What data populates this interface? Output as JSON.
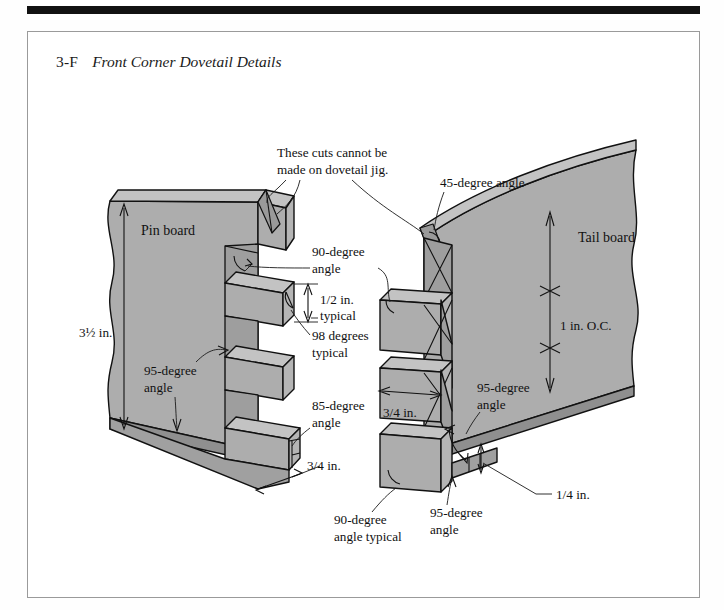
{
  "page": {
    "figure_number": "3-F",
    "figure_title": "Front Corner Dovetail Details",
    "background": "#ffffff",
    "frame_color": "#9a9a9a",
    "rule_color": "#111111"
  },
  "drawing": {
    "type": "isometric-technical-illustration",
    "subject": "hand-cut through dovetail joint, front corner",
    "fill_face": "#adadad",
    "fill_top": "#c3c3c3",
    "fill_end": "#8f8f8f",
    "fill_shadow": "#9a9a9a",
    "line_color": "#111111",
    "parts": [
      {
        "name": "pin-board",
        "label": "Pin board",
        "side": "left"
      },
      {
        "name": "tail-board",
        "label": "Tail board",
        "side": "right"
      }
    ]
  },
  "labels": {
    "pin_board": "Pin board",
    "tail_board": "Tail board",
    "note_jig_line1": "These cuts cannot be",
    "note_jig_line2": "made on dovetail jig.",
    "angle_45": "45-degree angle",
    "angle_90_line1": "90-degree",
    "angle_90_line2": "angle",
    "dim_half_line1": "1/2 in.",
    "dim_half_line2": "typical",
    "angle_98_line1": "98 degrees",
    "angle_98_line2": "typical",
    "angle_95_left_line1": "95-degree",
    "angle_95_left_line2": "angle",
    "angle_85_line1": "85-degree",
    "angle_85_line2": "angle",
    "dim_three_quarter_left": "3/4 in.",
    "dim_three_quarter_right": "3/4 in.",
    "dim_three_half": "3½ in.",
    "dim_one_inch_oc": "1 in. O.C.",
    "angle_95_right_line1": "95-degree",
    "angle_95_right_line2": "angle",
    "angle_95_bottom_line1": "95-degree",
    "angle_95_bottom_line2": "angle",
    "angle_90_typ_line1": "90-degree",
    "angle_90_typ_line2": "angle typical",
    "dim_quarter": "1/4 in."
  },
  "callouts": [
    {
      "id": "note-jig",
      "text": "These cuts cannot be made on dovetail jig.",
      "points_to": [
        "pin-board-top-cut",
        "tail-board-top-cut"
      ]
    },
    {
      "id": "angle-45",
      "text": "45-degree angle",
      "points_to": "tail-board-top-corner"
    },
    {
      "id": "angle-90",
      "text": "90-degree angle",
      "points_to": [
        "pin-socket-shoulder",
        "tail-socket-shoulder"
      ]
    },
    {
      "id": "dim-half",
      "text": "1/2 in. typical",
      "points_to": "pin-thickness"
    },
    {
      "id": "angle-98",
      "text": "98 degrees typical",
      "points_to": "pin-end-grain"
    },
    {
      "id": "angle-95-left",
      "text": "95-degree angle",
      "points_to": "pin-board-shoulder"
    },
    {
      "id": "angle-85",
      "text": "85-degree angle",
      "points_to": "pin-bottom-end"
    },
    {
      "id": "dim-34-left",
      "text": "3/4 in.",
      "points_to": "pin-board-thickness"
    },
    {
      "id": "dim-312",
      "text": "3½ in.",
      "points_to": "pin-board-width"
    },
    {
      "id": "dim-1-oc",
      "text": "1 in. O.C.",
      "points_to": "tail-spacing"
    },
    {
      "id": "dim-34-right",
      "text": "3/4 in.",
      "points_to": "tail-width"
    },
    {
      "id": "angle-95-right",
      "text": "95-degree angle",
      "points_to": "tail-board-shoulder"
    },
    {
      "id": "angle-95-bottom",
      "text": "95-degree angle",
      "points_to": "tail-bottom-notch"
    },
    {
      "id": "angle-90-typ",
      "text": "90-degree angle typical",
      "points_to": "tail-bottom-end"
    },
    {
      "id": "dim-14",
      "text": "1/4 in.",
      "points_to": "tail-bottom-shoulder"
    }
  ]
}
